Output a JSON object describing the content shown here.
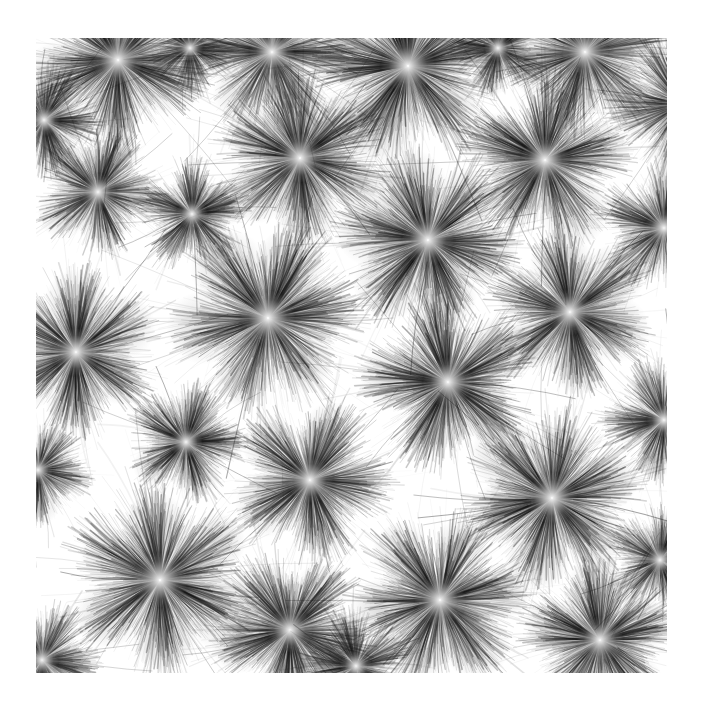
{
  "artwork": {
    "title": "Radial Burst Field",
    "medium": "generative-ink-strokes",
    "canvas_width": 703,
    "canvas_height": 709,
    "background_color": "#ffffff",
    "ink_color": "#101010",
    "plot_area": {
      "x": 36,
      "y": 38,
      "width": 631,
      "height": 635
    },
    "margins": {
      "left": 36,
      "top": 38,
      "right": 36,
      "bottom": 36
    },
    "palette": {
      "paper": "#ffffff",
      "ink_dark": "#0b0b0b",
      "ink_mid": "#555555",
      "ink_light": "#b4b4b4",
      "core_highlight": "#fdfdfd"
    },
    "style": {
      "stroke_count_per_burst": 1400,
      "stroke_min_width": 0.35,
      "stroke_max_width": 1.5,
      "core_radius_ratio": 0.07,
      "petal_lobes_min": 4,
      "petal_lobes_max": 7,
      "filament_curviness": 0.38,
      "global_seed": 20240517
    },
    "bursts": [
      {
        "id": "burst-01",
        "cx": 118,
        "cy": 60,
        "r": 86,
        "lobes": 5,
        "rot": 0.35,
        "density": 0.86,
        "darkness": 0.88
      },
      {
        "id": "burst-02",
        "cx": 272,
        "cy": 52,
        "r": 76,
        "lobes": 6,
        "rot": 1.1,
        "density": 0.74,
        "darkness": 0.8
      },
      {
        "id": "burst-03",
        "cx": 408,
        "cy": 66,
        "r": 92,
        "lobes": 5,
        "rot": 2.05,
        "density": 0.92,
        "darkness": 0.94
      },
      {
        "id": "burst-04",
        "cx": 585,
        "cy": 52,
        "r": 80,
        "lobes": 6,
        "rot": 0.8,
        "density": 0.8,
        "darkness": 0.84
      },
      {
        "id": "burst-05",
        "cx": 682,
        "cy": 104,
        "r": 70,
        "lobes": 5,
        "rot": 1.7,
        "density": 0.76,
        "darkness": 0.82
      },
      {
        "id": "burst-06",
        "cx": 98,
        "cy": 192,
        "r": 62,
        "lobes": 5,
        "rot": 2.6,
        "density": 0.72,
        "darkness": 0.78
      },
      {
        "id": "burst-07",
        "cx": 192,
        "cy": 214,
        "r": 52,
        "lobes": 5,
        "rot": 0.95,
        "density": 0.7,
        "darkness": 0.76
      },
      {
        "id": "burst-08",
        "cx": 300,
        "cy": 158,
        "r": 82,
        "lobes": 6,
        "rot": 1.45,
        "density": 0.86,
        "darkness": 0.9
      },
      {
        "id": "burst-09",
        "cx": 428,
        "cy": 240,
        "r": 88,
        "lobes": 6,
        "rot": 0.2,
        "density": 0.9,
        "darkness": 0.92
      },
      {
        "id": "burst-10",
        "cx": 545,
        "cy": 160,
        "r": 82,
        "lobes": 5,
        "rot": 2.3,
        "density": 0.84,
        "darkness": 0.88
      },
      {
        "id": "burst-11",
        "cx": 664,
        "cy": 228,
        "r": 64,
        "lobes": 5,
        "rot": 1.05,
        "density": 0.72,
        "darkness": 0.8
      },
      {
        "id": "burst-12",
        "cx": 76,
        "cy": 352,
        "r": 80,
        "lobes": 6,
        "rot": 0.55,
        "density": 0.86,
        "darkness": 0.88
      },
      {
        "id": "burst-13",
        "cx": 268,
        "cy": 318,
        "r": 92,
        "lobes": 6,
        "rot": 1.95,
        "density": 0.92,
        "darkness": 0.9
      },
      {
        "id": "burst-14",
        "cx": 448,
        "cy": 382,
        "r": 84,
        "lobes": 5,
        "rot": 0.7,
        "density": 0.88,
        "darkness": 0.92
      },
      {
        "id": "burst-15",
        "cx": 570,
        "cy": 312,
        "r": 78,
        "lobes": 6,
        "rot": 2.45,
        "density": 0.82,
        "darkness": 0.86
      },
      {
        "id": "burst-16",
        "cx": 186,
        "cy": 442,
        "r": 56,
        "lobes": 5,
        "rot": 1.25,
        "density": 0.7,
        "darkness": 0.8
      },
      {
        "id": "burst-17",
        "cx": 310,
        "cy": 480,
        "r": 78,
        "lobes": 5,
        "rot": 0.1,
        "density": 0.84,
        "darkness": 0.88
      },
      {
        "id": "burst-18",
        "cx": 664,
        "cy": 420,
        "r": 58,
        "lobes": 5,
        "rot": 1.8,
        "density": 0.7,
        "darkness": 0.8
      },
      {
        "id": "burst-19",
        "cx": 552,
        "cy": 498,
        "r": 86,
        "lobes": 6,
        "rot": 2.85,
        "density": 0.88,
        "darkness": 0.9
      },
      {
        "id": "burst-20",
        "cx": 160,
        "cy": 580,
        "r": 92,
        "lobes": 6,
        "rot": 0.45,
        "density": 0.9,
        "darkness": 0.92
      },
      {
        "id": "burst-21",
        "cx": 290,
        "cy": 630,
        "r": 76,
        "lobes": 5,
        "rot": 1.6,
        "density": 0.82,
        "darkness": 0.88
      },
      {
        "id": "burst-22",
        "cx": 440,
        "cy": 600,
        "r": 86,
        "lobes": 6,
        "rot": 0.9,
        "density": 0.88,
        "darkness": 0.92
      },
      {
        "id": "burst-23",
        "cx": 600,
        "cy": 640,
        "r": 78,
        "lobes": 5,
        "rot": 2.15,
        "density": 0.84,
        "darkness": 0.88
      },
      {
        "id": "burst-24",
        "cx": 44,
        "cy": 120,
        "r": 54,
        "lobes": 5,
        "rot": 1.35,
        "density": 0.66,
        "darkness": 0.78
      },
      {
        "id": "burst-25",
        "cx": 38,
        "cy": 470,
        "r": 50,
        "lobes": 5,
        "rot": 0.25,
        "density": 0.64,
        "darkness": 0.76
      },
      {
        "id": "burst-26",
        "cx": 42,
        "cy": 660,
        "r": 56,
        "lobes": 5,
        "rot": 2.7,
        "density": 0.66,
        "darkness": 0.78
      },
      {
        "id": "burst-27",
        "cx": 660,
        "cy": 560,
        "r": 52,
        "lobes": 5,
        "rot": 1.15,
        "density": 0.64,
        "darkness": 0.76
      },
      {
        "id": "burst-28",
        "cx": 498,
        "cy": 48,
        "r": 46,
        "lobes": 5,
        "rot": 0.6,
        "density": 0.6,
        "darkness": 0.74
      },
      {
        "id": "burst-29",
        "cx": 356,
        "cy": 666,
        "r": 54,
        "lobes": 5,
        "rot": 2.0,
        "density": 0.66,
        "darkness": 0.8
      },
      {
        "id": "burst-30",
        "cx": 190,
        "cy": 48,
        "r": 44,
        "lobes": 5,
        "rot": 1.5,
        "density": 0.58,
        "darkness": 0.72
      }
    ]
  }
}
